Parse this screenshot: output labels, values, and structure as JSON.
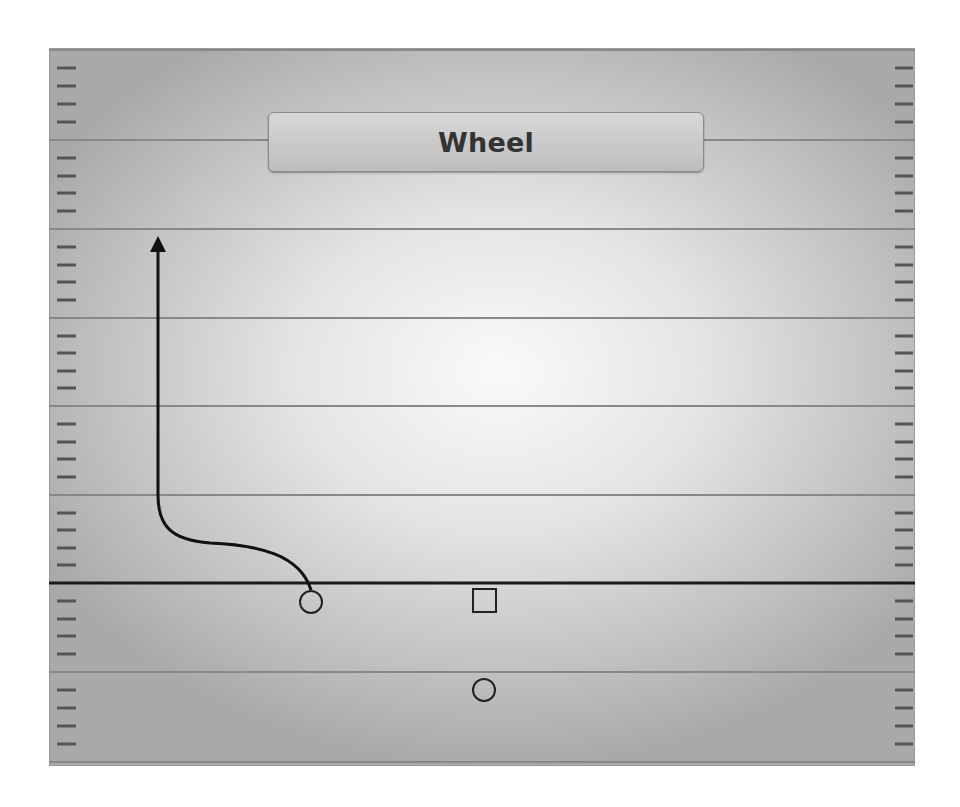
{
  "diagram": {
    "title": "Wheel",
    "type": "football-play-diagram",
    "colors": {
      "yard_line": "#888888",
      "line_of_scrimmage": "#1a1a1a",
      "route": "#111111",
      "hash_mark": "#555555",
      "title_text": "#333333"
    },
    "field": {
      "x": 49,
      "y": 48,
      "width": 866,
      "height": 718
    },
    "yard_lines_y": [
      50,
      140,
      229,
      318,
      406,
      495,
      672,
      762
    ],
    "line_of_scrimmage_y": 583,
    "players": [
      {
        "id": "receiver-left",
        "shape": "circle",
        "x": 311,
        "y": 602,
        "role": "route runner"
      },
      {
        "id": "center",
        "shape": "square",
        "x": 484,
        "y": 601
      },
      {
        "id": "quarterback",
        "shape": "circle",
        "x": 484,
        "y": 690
      }
    ],
    "routes": [
      {
        "from": "receiver-left",
        "name": "Wheel",
        "path": "curve left along scrimmage area then vertical upfield",
        "end_arrow": {
          "x": 158,
          "y": 237
        }
      }
    ]
  }
}
